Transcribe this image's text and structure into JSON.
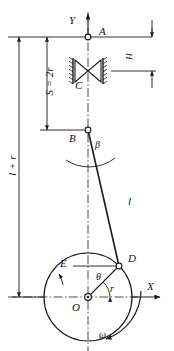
{
  "diagram": {
    "type": "mechanism-schematic",
    "stroke_color": "#1a1a1a",
    "background_color": "#ffffff"
  },
  "axes": {
    "y_label": "Y",
    "x_label": "X"
  },
  "points": {
    "a": "A",
    "b": "B",
    "c": "C",
    "d": "D",
    "e": "E",
    "o": "O"
  },
  "dimensions": {
    "stroke": "S = 2r",
    "total_length": "l + r",
    "head_height": "H"
  },
  "annotations": {
    "rod_length": "l",
    "crank_radius": "r",
    "crank_angle": "θ",
    "rod_angle": "β",
    "angular_velocity": "ω"
  },
  "geometry": {
    "center_x": 88,
    "a_y": 37,
    "c_y": 71,
    "b_y": 130,
    "o_y": 297,
    "circle_radius": 44,
    "d_x": 119,
    "d_y": 266
  }
}
